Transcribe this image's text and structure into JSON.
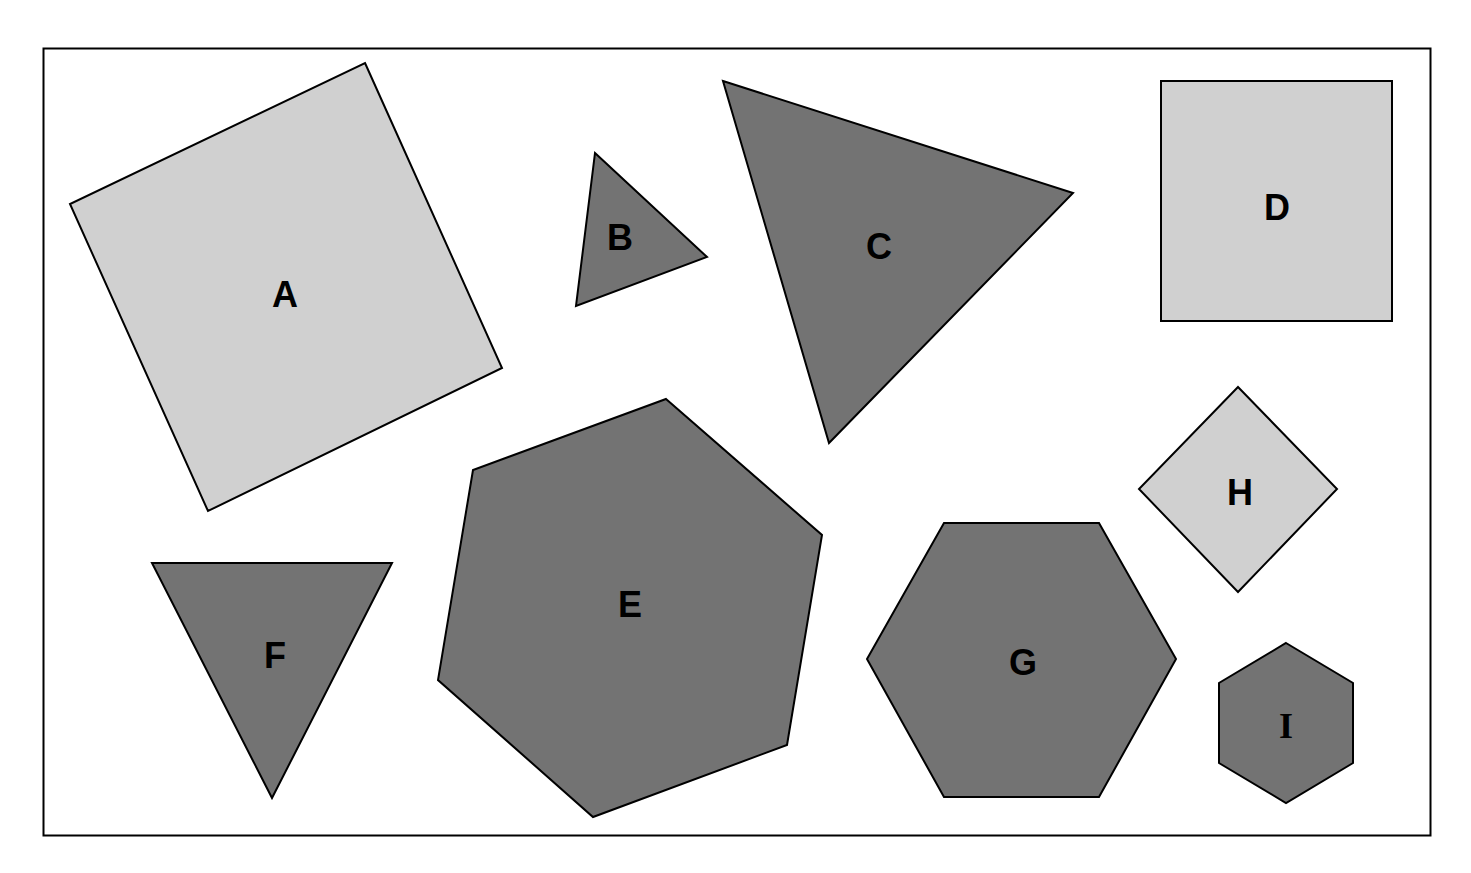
{
  "colors": {
    "light": "#d0d0d0",
    "dark": "#737373",
    "stroke": "#000000",
    "background": "#ffffff"
  },
  "shapes": [
    {
      "label": "A",
      "kind": "square",
      "fill": "light",
      "rotated": true
    },
    {
      "label": "B",
      "kind": "triangle",
      "fill": "dark"
    },
    {
      "label": "C",
      "kind": "triangle",
      "fill": "dark"
    },
    {
      "label": "D",
      "kind": "square",
      "fill": "light"
    },
    {
      "label": "E",
      "kind": "heptagon-like hexagon",
      "fill": "dark"
    },
    {
      "label": "F",
      "kind": "triangle",
      "fill": "dark",
      "pointing": "down"
    },
    {
      "label": "G",
      "kind": "hexagon",
      "fill": "dark"
    },
    {
      "label": "H",
      "kind": "diamond",
      "fill": "light"
    },
    {
      "label": "I",
      "kind": "hexagon",
      "fill": "dark"
    }
  ]
}
